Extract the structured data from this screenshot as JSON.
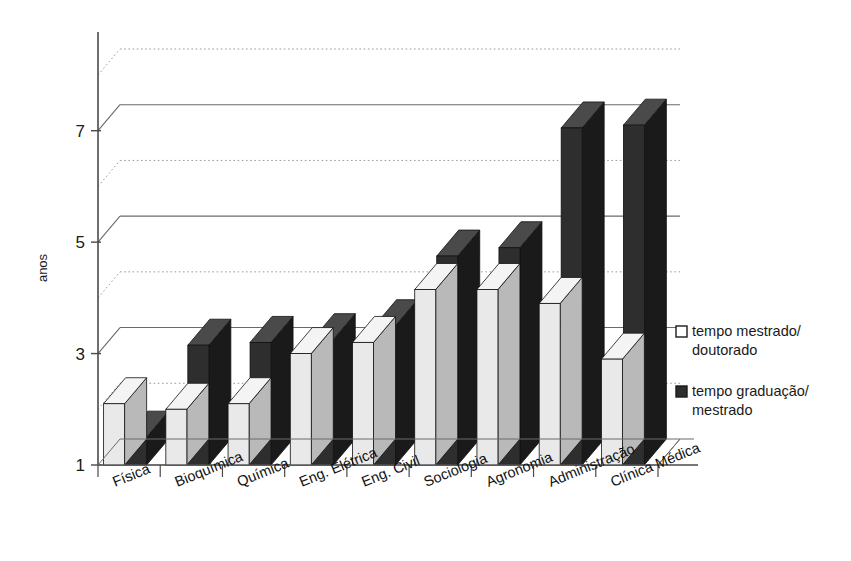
{
  "chart_data": {
    "type": "bar",
    "title": "",
    "subtitle": "",
    "xlabel": "",
    "ylabel": "anos",
    "ylim": [
      1,
      8
    ],
    "yticks": [
      1,
      3,
      5,
      7
    ],
    "ytick_labels": [
      "1",
      "3",
      "5",
      "7"
    ],
    "gridlines_dotted_at": [
      2,
      4,
      6,
      8
    ],
    "grid": true,
    "legend_position": "right",
    "style": "3d-column",
    "categories": [
      "Física",
      "Bioquímica",
      "Química",
      "Eng. Elétrica",
      "Eng. Civil",
      "Sociologia",
      "Agronomia",
      "Administração",
      "Clínica Médica"
    ],
    "series": [
      {
        "name": "tempo mestrado/doutorado",
        "legend_line1": "tempo mestrado/",
        "legend_line2": "doutorado",
        "color": "#e8e8e8",
        "values": [
          2.1,
          2.0,
          2.1,
          3.0,
          3.2,
          4.15,
          4.15,
          3.9,
          2.9
        ]
      },
      {
        "name": "tempo graduação/mestrado",
        "legend_line1": "tempo graduação/",
        "legend_line2": "mestrado",
        "color": "#2b2b2b",
        "values": [
          1.5,
          3.15,
          3.2,
          3.25,
          3.5,
          4.75,
          4.9,
          7.05,
          7.1
        ]
      }
    ]
  },
  "colors": {
    "axis": "#4a4a4a",
    "grid_solid": "#6a6a6a",
    "grid_dotted": "#9a9a9a",
    "light_face": "#e9e9e9",
    "light_side": "#b9b9b9",
    "light_top": "#f4f4f4",
    "dark_face": "#2e2e2e",
    "dark_side": "#1a1a1a",
    "dark_top": "#4a4a4a",
    "floor": "#ffffff",
    "text": "#1a1a1a"
  }
}
